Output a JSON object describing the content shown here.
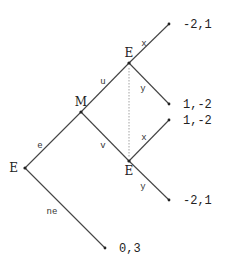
{
  "diagram": {
    "type": "extensive-form game tree",
    "nodes": [
      {
        "id": "root",
        "player": "E",
        "x": 25,
        "y": 168,
        "label_x": 18,
        "label_y": 172,
        "anchor": "end"
      },
      {
        "id": "m",
        "player": "M",
        "x": 81,
        "y": 112,
        "label_x": 81,
        "label_y": 106,
        "anchor": "middle"
      },
      {
        "id": "e_upper",
        "player": "E",
        "x": 129,
        "y": 63,
        "label_x": 129,
        "label_y": 57,
        "anchor": "middle"
      },
      {
        "id": "e_lower",
        "player": "E",
        "x": 129,
        "y": 161,
        "label_x": 129,
        "label_y": 175,
        "anchor": "middle"
      }
    ],
    "terminals": [
      {
        "id": "t1",
        "x": 169,
        "y": 24,
        "payoff": "-2,1"
      },
      {
        "id": "t2",
        "x": 169,
        "y": 104,
        "payoff": "1,-2"
      },
      {
        "id": "t3",
        "x": 169,
        "y": 120,
        "payoff": "1,-2"
      },
      {
        "id": "t4",
        "x": 169,
        "y": 200,
        "payoff": "-2,1"
      },
      {
        "id": "t5",
        "x": 105,
        "y": 248,
        "payoff": "0,3"
      }
    ],
    "edges": [
      {
        "from": "root",
        "to": "m",
        "label": "e",
        "lx": 40,
        "ly": 148
      },
      {
        "from": "root",
        "to": "t5",
        "label": "ne",
        "lx": 52,
        "ly": 214
      },
      {
        "from": "m",
        "to": "e_upper",
        "label": "u",
        "lx": 103,
        "ly": 84
      },
      {
        "from": "m",
        "to": "e_lower",
        "label": "v",
        "lx": 103,
        "ly": 148
      },
      {
        "from": "e_upper",
        "to": "t1",
        "label": "x",
        "lx": 144,
        "ly": 46
      },
      {
        "from": "e_upper",
        "to": "t2",
        "label": "y",
        "lx": 143,
        "ly": 91
      },
      {
        "from": "e_lower",
        "to": "t3",
        "label": "x",
        "lx": 144,
        "ly": 140
      },
      {
        "from": "e_lower",
        "to": "t4",
        "label": "y",
        "lx": 143,
        "ly": 189
      }
    ],
    "information_set": {
      "nodes": [
        "e_upper",
        "e_lower"
      ],
      "style": "dotted"
    }
  }
}
